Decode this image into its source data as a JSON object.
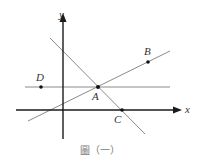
{
  "figure": {
    "caption": "圖（一）",
    "axes": {
      "x_label": "x",
      "y_label": "y"
    },
    "points": [
      {
        "name": "A",
        "label": "A"
      },
      {
        "name": "B",
        "label": "B"
      },
      {
        "name": "C",
        "label": "C"
      },
      {
        "name": "D",
        "label": "D"
      }
    ],
    "lines": [
      {
        "name": "horizontal-line-DA",
        "through": [
          "D",
          "A"
        ]
      },
      {
        "name": "line-AB",
        "through": [
          "A",
          "B"
        ]
      },
      {
        "name": "line-AC",
        "through": [
          "A",
          "C"
        ]
      }
    ],
    "colors": {
      "axis": "#1a1a1a",
      "line": "#8a8a8a",
      "point": "#111111",
      "caption": "#7a7a7a"
    }
  }
}
